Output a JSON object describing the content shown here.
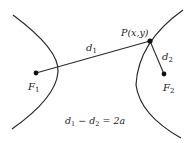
{
  "diagram": {
    "colors": {
      "stroke": "#2a2a2a",
      "text": "#222222",
      "background": "#ffffff"
    },
    "points": {
      "F1": {
        "label": "F",
        "sub": "1",
        "x": 36,
        "y": 73
      },
      "F2": {
        "label": "F",
        "sub": "2",
        "x": 164,
        "y": 74
      },
      "P": {
        "label": "P(x,y)",
        "x": 150,
        "y": 41
      }
    },
    "segments": {
      "d1": {
        "label": "d",
        "sub": "1"
      },
      "d2": {
        "label": "d",
        "sub": "2"
      }
    },
    "equation": {
      "lhs1": "d",
      "lhs1_sub": "1",
      "minus": " − ",
      "lhs2": "d",
      "lhs2_sub": "2",
      "rhs": " = 2a"
    }
  }
}
